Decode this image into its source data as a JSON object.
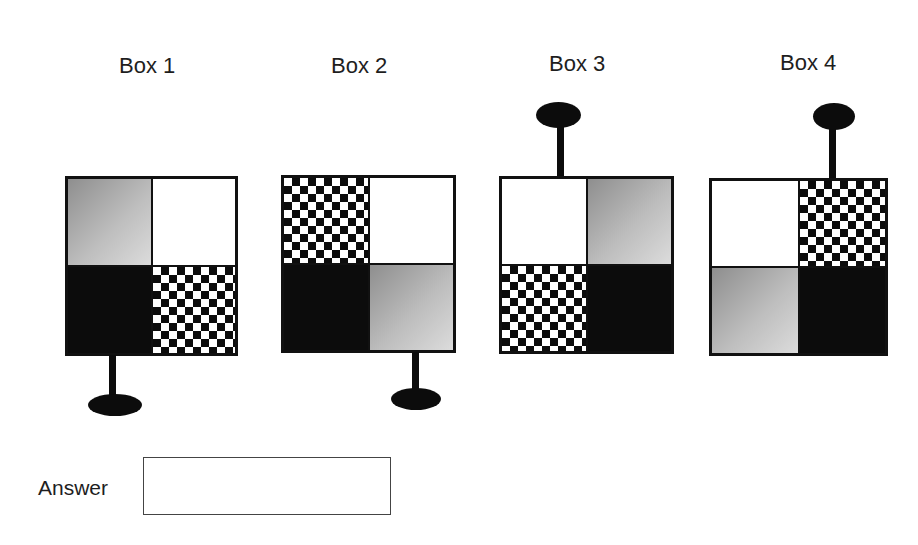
{
  "boxes": [
    {
      "label": "Box 1",
      "quadrants": {
        "top_left": "gradient",
        "top_right": "white",
        "bottom_left": "black",
        "bottom_right": "checker"
      },
      "knob": {
        "side": "bottom",
        "position": "left"
      }
    },
    {
      "label": "Box 2",
      "quadrants": {
        "top_left": "checker",
        "top_right": "white",
        "bottom_left": "black",
        "bottom_right": "gradient"
      },
      "knob": {
        "side": "bottom",
        "position": "right"
      }
    },
    {
      "label": "Box 3",
      "quadrants": {
        "top_left": "white",
        "top_right": "gradient",
        "bottom_left": "checker",
        "bottom_right": "black"
      },
      "knob": {
        "side": "top",
        "position": "left"
      }
    },
    {
      "label": "Box 4",
      "quadrants": {
        "top_left": "white",
        "top_right": "checker",
        "bottom_left": "gradient",
        "bottom_right": "black"
      },
      "knob": {
        "side": "top",
        "position": "right"
      }
    }
  ],
  "answer": {
    "label": "Answer",
    "value": "",
    "placeholder": ""
  },
  "colors": {
    "black_fill": "#0c0c0c",
    "white_fill": "#ffffff",
    "gradient_dark": "#8e8e8e",
    "gradient_light": "#dcdcdc",
    "outline": "#111111"
  }
}
